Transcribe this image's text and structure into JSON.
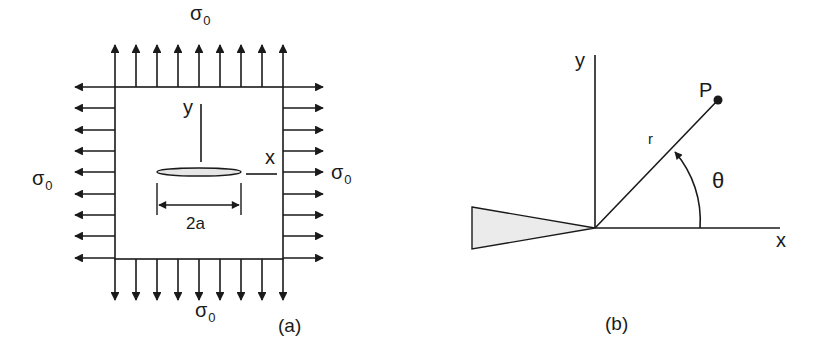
{
  "panel_a": {
    "caption": "(a)",
    "stress_symbol": "σ",
    "stress_subscript": "0",
    "top_label": "σ",
    "axis_y": "y",
    "axis_x": "x",
    "crack_length": "2a",
    "arrow_count_per_side": 9
  },
  "panel_b": {
    "caption": "(b)",
    "axis_y": "y",
    "axis_x": "x",
    "point_label": "P",
    "radius_label": "r",
    "angle_label": "θ"
  },
  "colors": {
    "ink": "#1a1a1a",
    "fill": "#e8e8e8",
    "background": "#ffffff"
  }
}
